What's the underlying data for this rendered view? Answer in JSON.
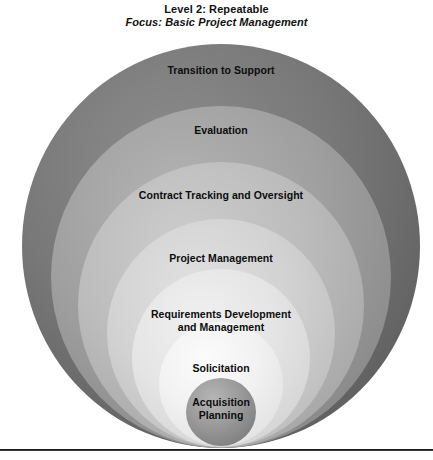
{
  "title": {
    "line1": "Level 2: Repeatable",
    "line2": "Focus: Basic Project Management"
  },
  "diagram": {
    "type": "concentric-ellipse-nesting",
    "rings": [
      {
        "id": "transition-to-support",
        "label": "Transition to Support",
        "order": 1,
        "depth": "outermost",
        "fill": "#787878",
        "fill_light": "#8d8d8d",
        "fill_dark": "#5e5e5e",
        "cx": 221,
        "cy": 246,
        "rx": 199,
        "ry": 202,
        "label_x": 221,
        "label_y": 71
      },
      {
        "id": "evaluation",
        "label": "Evaluation",
        "order": 2,
        "fill": "#a0a0a0",
        "fill_light": "#b4b4b4",
        "fill_dark": "#888888",
        "cx": 221,
        "cy": 277,
        "rx": 170,
        "ry": 171,
        "label_x": 221,
        "label_y": 131
      },
      {
        "id": "contract-tracking-and-oversight",
        "label": "Contract Tracking and Oversight",
        "order": 3,
        "fill": "#bcbcbc",
        "fill_light": "#cdcdcd",
        "fill_dark": "#a6a6a6",
        "cx": 221,
        "cy": 305,
        "rx": 143,
        "ry": 143,
        "label_x": 221,
        "label_y": 196
      },
      {
        "id": "project-management",
        "label": "Project Management",
        "order": 4,
        "fill": "#d2d2d2",
        "fill_light": "#e0e0e0",
        "fill_dark": "#bdbdbd",
        "cx": 221,
        "cy": 333,
        "rx": 114,
        "ry": 114,
        "label_x": 221,
        "label_y": 259
      },
      {
        "id": "requirements-development-and-management",
        "label": "Requirements Development\nand Management",
        "order": 5,
        "fill": "#e5e5e5",
        "fill_light": "#f0f0f0",
        "fill_dark": "#d4d4d4",
        "cx": 221,
        "cy": 358,
        "rx": 89,
        "ry": 89,
        "label_x": 221,
        "label_y": 315
      },
      {
        "id": "solicitation",
        "label": "Solicitation",
        "order": 6,
        "fill": "#f2f2f2",
        "fill_light": "#fbfbfb",
        "fill_dark": "#e2e2e2",
        "cx": 221,
        "cy": 384,
        "rx": 62,
        "ry": 62,
        "label_x": 221,
        "label_y": 369
      },
      {
        "id": "acquisition-planning",
        "label": "Acquisition\nPlanning",
        "order": 7,
        "depth": "innermost",
        "fill": "#9a9a9a",
        "fill_light": "#b6b6b6",
        "fill_dark": "#7d7d7d",
        "cx": 221,
        "cy": 412,
        "rx": 35,
        "ry": 34,
        "label_x": 221,
        "label_y": 403
      }
    ]
  },
  "divider": {
    "name": "bottom-horizontal-rule",
    "color": "#1b1b1b"
  }
}
